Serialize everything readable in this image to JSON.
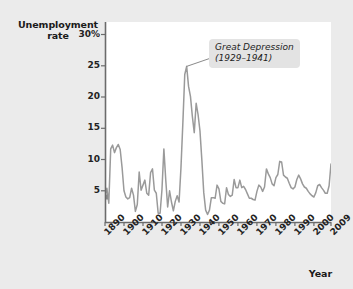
{
  "chart_data": {
    "type": "line",
    "title": "",
    "xlabel": "Year",
    "ylabel": "Unemployment\nrate",
    "ylim": [
      0,
      32
    ],
    "xlim": [
      1890,
      2009
    ],
    "grid": false,
    "legend": "none",
    "y_tick_labels": [
      "30%",
      "25",
      "20",
      "15",
      "10",
      "5"
    ],
    "y_tick_values": [
      30,
      25,
      20,
      15,
      10,
      5
    ],
    "x_tick_labels": [
      "1890",
      "1900",
      "1910",
      "1920",
      "1930",
      "1940",
      "1950",
      "1960",
      "1970",
      "1980",
      "1990",
      "2000",
      "2009"
    ],
    "x_tick_values": [
      1890,
      1900,
      1910,
      1920,
      1930,
      1940,
      1950,
      1960,
      1970,
      1980,
      1990,
      2000,
      2009
    ],
    "line_color": "#9a9a9a",
    "marker_note": "square marker at first data point (1890)",
    "series": [
      {
        "name": "Unemployment rate",
        "x": [
          1890,
          1891,
          1892,
          1893,
          1894,
          1895,
          1896,
          1897,
          1898,
          1899,
          1900,
          1901,
          1902,
          1903,
          1904,
          1905,
          1906,
          1907,
          1908,
          1909,
          1910,
          1911,
          1912,
          1913,
          1914,
          1915,
          1916,
          1917,
          1918,
          1919,
          1920,
          1921,
          1922,
          1923,
          1924,
          1925,
          1926,
          1927,
          1928,
          1929,
          1930,
          1931,
          1932,
          1933,
          1934,
          1935,
          1936,
          1937,
          1938,
          1939,
          1940,
          1941,
          1942,
          1943,
          1944,
          1945,
          1946,
          1947,
          1948,
          1949,
          1950,
          1951,
          1952,
          1953,
          1954,
          1955,
          1956,
          1957,
          1958,
          1959,
          1960,
          1961,
          1962,
          1963,
          1964,
          1965,
          1966,
          1967,
          1968,
          1969,
          1970,
          1971,
          1972,
          1973,
          1974,
          1975,
          1976,
          1977,
          1978,
          1979,
          1980,
          1981,
          1982,
          1983,
          1984,
          1985,
          1986,
          1987,
          1988,
          1989,
          1990,
          1991,
          1992,
          1993,
          1994,
          1995,
          1996,
          1997,
          1998,
          1999,
          2000,
          2001,
          2002,
          2003,
          2004,
          2005,
          2006,
          2007,
          2008,
          2009
        ],
        "values": [
          4.0,
          5.4,
          3.0,
          11.7,
          12.3,
          11.1,
          11.9,
          12.4,
          11.6,
          8.7,
          5.0,
          4.0,
          3.7,
          3.9,
          5.4,
          4.3,
          1.7,
          2.8,
          8.0,
          5.1,
          5.9,
          6.7,
          4.6,
          4.3,
          7.9,
          8.5,
          5.1,
          4.6,
          1.4,
          1.4,
          5.2,
          11.7,
          6.7,
          2.4,
          5.0,
          3.2,
          1.8,
          3.3,
          4.2,
          3.2,
          8.7,
          15.9,
          23.6,
          24.9,
          21.7,
          20.1,
          16.9,
          14.3,
          19.0,
          17.2,
          14.6,
          9.9,
          4.7,
          1.9,
          1.2,
          1.9,
          3.9,
          3.9,
          3.8,
          5.9,
          5.3,
          3.3,
          3.0,
          2.9,
          5.5,
          4.4,
          4.1,
          4.3,
          6.8,
          5.5,
          5.5,
          6.7,
          5.5,
          5.7,
          5.2,
          4.5,
          3.8,
          3.8,
          3.6,
          3.5,
          4.9,
          5.9,
          5.6,
          4.9,
          5.6,
          8.5,
          7.7,
          7.1,
          6.1,
          5.8,
          7.1,
          7.6,
          9.7,
          9.6,
          7.5,
          7.2,
          7.0,
          6.2,
          5.5,
          5.3,
          5.6,
          6.8,
          7.5,
          6.9,
          6.1,
          5.6,
          5.4,
          4.9,
          4.5,
          4.2,
          4.0,
          4.7,
          5.8,
          6.0,
          5.5,
          5.1,
          4.6,
          4.6,
          5.8,
          9.3
        ]
      }
    ],
    "annotations": [
      {
        "text": "Great Depression\n(1929–1941)",
        "points_to_year": 1933,
        "points_to_value": 24.9,
        "style": "italic rounded gray box with leader line"
      }
    ]
  },
  "figure": {
    "background_color": "#ebebeb",
    "plot_background_color": "#ffffff",
    "axis_color": "#555555"
  }
}
